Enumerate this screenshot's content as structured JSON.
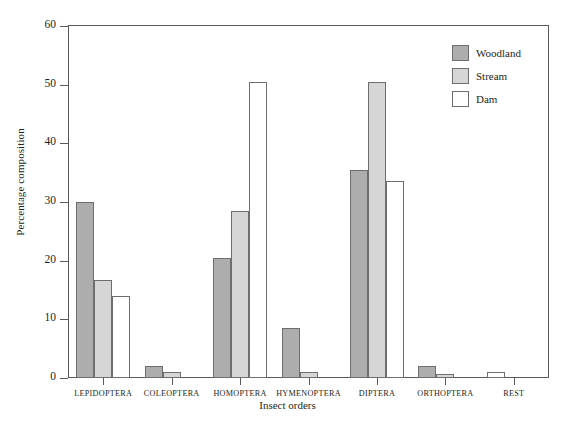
{
  "chart_data": {
    "type": "bar",
    "title": "",
    "xlabel": "Insect orders",
    "ylabel": "Percentage composition",
    "ylim": [
      0,
      60
    ],
    "yticks": [
      0,
      10,
      20,
      30,
      40,
      50,
      60
    ],
    "grid": false,
    "legend_position": "top-right",
    "categories": [
      "LEPIDOPTERA",
      "COLEOPTERA",
      "HOMOPTERA",
      "HYMENOPTERA",
      "DIPTERA",
      "ORTHOPTERA",
      "REST"
    ],
    "series": [
      {
        "name": "Woodland",
        "color": "#adadad",
        "values": [
          30.0,
          2.0,
          20.5,
          8.5,
          35.5,
          2.0,
          0.0
        ]
      },
      {
        "name": "Stream",
        "color": "#d6d6d6",
        "values": [
          16.7,
          1.0,
          28.5,
          1.0,
          50.5,
          0.6,
          0.0
        ]
      },
      {
        "name": "Dam",
        "color": "#ffffff",
        "values": [
          14.0,
          0.0,
          50.5,
          0.0,
          33.5,
          0.0,
          1.0
        ]
      }
    ]
  },
  "axes": {
    "y_title": "Percentage composition",
    "x_title": "Insect orders",
    "y_tick_labels": [
      "0",
      "10",
      "20",
      "30",
      "40",
      "50",
      "60"
    ]
  },
  "legend": {
    "entries": [
      {
        "label": "Woodland",
        "swatch": "woodland"
      },
      {
        "label": "Stream",
        "swatch": "stream"
      },
      {
        "label": "Dam",
        "swatch": "dam"
      }
    ]
  },
  "colors": {
    "woodland": "#adadad",
    "stream": "#d6d6d6",
    "dam": "#ffffff",
    "outline": "#6d6e70",
    "axis": "#58595b",
    "text": "#231f20"
  }
}
